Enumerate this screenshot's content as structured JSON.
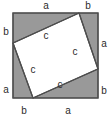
{
  "figure": {
    "name": "pythagorean-theorem-square-diagram",
    "canvas": {
      "width": 110,
      "height": 118
    },
    "background_color": "#ffffff",
    "outer_square": {
      "name": "outer-square",
      "fill_color": "#999999",
      "stroke_color": "#4d4d4d",
      "x": 13,
      "y": 13,
      "size": 85
    },
    "inner_square": {
      "name": "inner-square",
      "fill_color": "#ffffff",
      "stroke_color": "#4d4d4d",
      "points": "79,13 98,69 33,98 13,43"
    },
    "triangle_fill_color": "#999999",
    "outline_color": "#4d4d4d"
  },
  "labels": {
    "outer_top_left": {
      "text": "a",
      "x": 46,
      "y": 6
    },
    "outer_top_right": {
      "text": "b",
      "x": 88,
      "y": 6
    },
    "outer_right_upper": {
      "text": "a",
      "x": 104,
      "y": 44
    },
    "outer_right_lower": {
      "text": "b",
      "x": 104,
      "y": 91
    },
    "outer_bottom_left": {
      "text": "b",
      "x": 24,
      "y": 111
    },
    "outer_bottom_right": {
      "text": "a",
      "x": 68,
      "y": 111
    },
    "outer_left_lower": {
      "text": "a",
      "x": 6,
      "y": 90
    },
    "outer_left_upper": {
      "text": "b",
      "x": 6,
      "y": 32
    },
    "inner_top": {
      "text": "c",
      "x": 46,
      "y": 36
    },
    "inner_right": {
      "text": "c",
      "x": 75,
      "y": 52
    },
    "inner_left": {
      "text": "c",
      "x": 33,
      "y": 70
    },
    "inner_bottom": {
      "text": "c",
      "x": 60,
      "y": 85
    }
  }
}
